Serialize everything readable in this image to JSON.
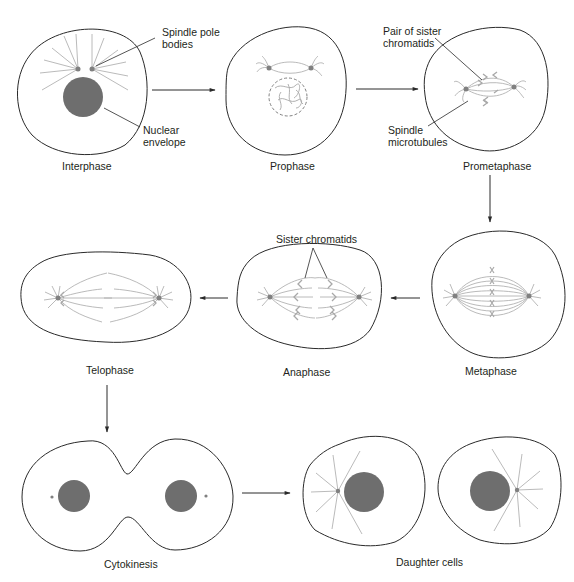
{
  "figure": {
    "colors": {
      "outline": "#2a2a2a",
      "nucleus": "#6e6e6e",
      "spindle": "#a8a8a8",
      "pole": "#808080",
      "text": "#231f20",
      "background": "#ffffff"
    }
  },
  "stages": [
    {
      "id": "interphase",
      "label": "Interphase"
    },
    {
      "id": "prophase",
      "label": "Prophase"
    },
    {
      "id": "prometaphase",
      "label": "Prometaphase"
    },
    {
      "id": "metaphase",
      "label": "Metaphase"
    },
    {
      "id": "anaphase",
      "label": "Anaphase"
    },
    {
      "id": "telophase",
      "label": "Telophase"
    },
    {
      "id": "cytokinesis",
      "label": "Cytokinesis"
    },
    {
      "id": "daughter-cells",
      "label": "Daughter cells"
    }
  ],
  "callouts": {
    "spindle_pole_bodies": "Spindle pole\nbodies",
    "nuclear_envelope": "Nuclear\nenvelope",
    "pair_of_sister_chromatids": "Pair of sister\nchromatids",
    "spindle_microtubules": "Spindle\nmicrotubules",
    "sister_chromatids": "Sister chromatids"
  },
  "flow": [
    "Interphase → Prophase",
    "Prophase → Prometaphase",
    "Prometaphase → Metaphase",
    "Metaphase → Anaphase",
    "Anaphase → Telophase",
    "Telophase → Cytokinesis",
    "Cytokinesis → Daughter cells"
  ]
}
